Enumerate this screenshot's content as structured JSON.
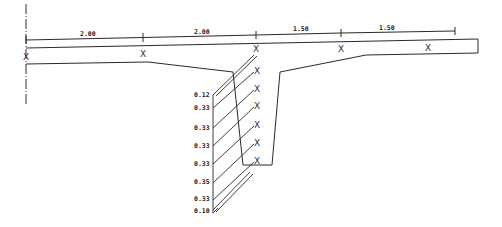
{
  "drawing": {
    "type": "bridge cross-section (T-beam deck) with dimension line and segment markers",
    "line_color": "#2a2a2a",
    "dimensions": [
      {
        "label": "2.00",
        "x": 86,
        "y": 35
      },
      {
        "label": "2.00",
        "x": 200,
        "y": 33
      },
      {
        "label": "1.50",
        "x": 298,
        "y": 30
      },
      {
        "label": "1.50",
        "x": 384,
        "y": 29
      }
    ],
    "marker_symbol": "X",
    "deck_markers": [
      {
        "x": 26,
        "y": 59
      },
      {
        "x": 143,
        "y": 56
      },
      {
        "x": 256,
        "y": 51
      },
      {
        "x": 341,
        "y": 51
      },
      {
        "x": 428,
        "y": 50
      }
    ],
    "web_markers": [
      {
        "x": 258,
        "y": 73
      },
      {
        "x": 258,
        "y": 91
      },
      {
        "x": 258,
        "y": 108
      },
      {
        "x": 258,
        "y": 127
      },
      {
        "x": 258,
        "y": 145
      },
      {
        "x": 258,
        "y": 163
      }
    ],
    "layer_labels": [
      {
        "label": "0.12",
        "x": 195,
        "y": 98
      },
      {
        "label": "0.33",
        "x": 195,
        "y": 110
      },
      {
        "label": "0.33",
        "x": 195,
        "y": 130
      },
      {
        "label": "0.33",
        "x": 195,
        "y": 148
      },
      {
        "label": "0.33",
        "x": 195,
        "y": 166
      },
      {
        "label": "0.35",
        "x": 195,
        "y": 185
      },
      {
        "label": "0.33",
        "x": 195,
        "y": 201
      },
      {
        "label": "0.10",
        "x": 195,
        "y": 213
      }
    ]
  }
}
